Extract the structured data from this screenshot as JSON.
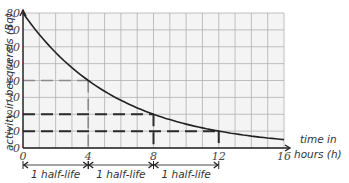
{
  "chart_data": {
    "type": "line",
    "title": "",
    "xlabel": "time in hours (h)",
    "ylabel": "activity in becquerels (Bq)",
    "xlim": [
      0,
      16
    ],
    "ylim": [
      0,
      80
    ],
    "x_ticks": [
      0,
      4,
      8,
      12,
      16
    ],
    "y_ticks": [
      0,
      10,
      20,
      30,
      40,
      50,
      60,
      70,
      80
    ],
    "grid": true,
    "series": [
      {
        "name": "activity",
        "x": [
          0,
          1,
          2,
          3,
          4,
          5,
          6,
          7,
          8,
          9,
          10,
          11,
          12,
          13,
          14,
          15,
          16
        ],
        "values": [
          80,
          67.3,
          56.6,
          47.6,
          40,
          33.6,
          28.3,
          23.8,
          20,
          16.8,
          14.1,
          11.9,
          10,
          8.4,
          7.1,
          5.9,
          5
        ]
      }
    ],
    "guides": [
      {
        "value": 40,
        "at_x": 4,
        "style": "light-dashed"
      },
      {
        "value": 20,
        "at_x": 8,
        "style": "dark-dashed"
      },
      {
        "value": 10,
        "at_x": 12,
        "style": "dark-dashed"
      }
    ],
    "annotations": [
      {
        "from": 0,
        "to": 4,
        "text": "1 half-life"
      },
      {
        "from": 4,
        "to": 8,
        "text": "1 half-life"
      },
      {
        "from": 8,
        "to": 12,
        "text": "1 half-life"
      }
    ]
  },
  "labels": {
    "xlabel_line1": "time in",
    "xlabel_line2": "hours (h)",
    "ylabel": "activity in becquerels (Bq)",
    "x_ticks": [
      "0",
      "4",
      "8",
      "12",
      "16"
    ],
    "y_ticks": [
      "0",
      "10",
      "20",
      "30",
      "40",
      "50",
      "60",
      "70",
      "80"
    ],
    "half_life": [
      "1 half-life",
      "1 half-life",
      "1 half-life"
    ]
  },
  "colors": {
    "grid": "#b0b0b0",
    "grid_bg": "#f4f4f4",
    "curve": "#222222",
    "dark_dash": "#2a2a2a",
    "light_dash": "#8a8a8a"
  }
}
